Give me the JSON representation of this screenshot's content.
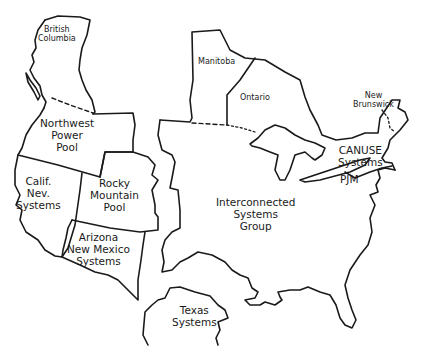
{
  "map": {
    "title": "",
    "stroke_color": "#1a1a1a",
    "background": "#ffffff",
    "regions": [
      {
        "id": "british-columbia",
        "label": "British\nColumbia",
        "size": "small"
      },
      {
        "id": "northwest-power-pool",
        "label": "Northwest\nPower\nPool",
        "size": "large"
      },
      {
        "id": "calif-nev-systems",
        "label": "Calif.\nNev.\nSystems",
        "size": "large"
      },
      {
        "id": "rocky-mountain-pool",
        "label": "Rocky\nMountain\nPool",
        "size": "large"
      },
      {
        "id": "arizona-new-mexico-systems",
        "label": "Arizona\nNew Mexico\nSystems",
        "size": "large"
      },
      {
        "id": "manitoba",
        "label": "Manitoba",
        "size": "small"
      },
      {
        "id": "ontario",
        "label": "Ontario",
        "size": "small"
      },
      {
        "id": "new-brunswick",
        "label": "New\nBrunswick",
        "size": "small"
      },
      {
        "id": "canuse-systems",
        "label": "CANUSE\nSystems",
        "size": "large"
      },
      {
        "id": "pjm",
        "label": "PJM",
        "size": "large"
      },
      {
        "id": "interconnected-systems-group",
        "label": "Interconnected\nSystems\nGroup",
        "size": "large"
      },
      {
        "id": "texas-systems",
        "label": "Texas\nSystems",
        "size": "large"
      }
    ],
    "borders": {
      "canada_us_border_style": "dashed",
      "new_brunswick_border_style": "dotted"
    }
  }
}
